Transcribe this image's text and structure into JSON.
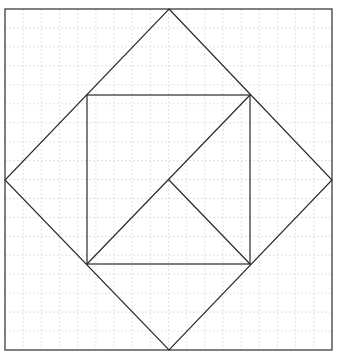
{
  "diagram": {
    "type": "geometric-figure",
    "colors": {
      "background": "#ffffff",
      "grid": "#d9d9d9",
      "lines": "#2b2b2b",
      "frame": "#4a4a4a"
    },
    "grid": {
      "divisions": 18,
      "dashed": true
    },
    "outer_square": {
      "x1": 5,
      "y1": 9,
      "x2": 332,
      "y2": 350
    },
    "diamond": {
      "points": [
        [
          169,
          9
        ],
        [
          332,
          180
        ],
        [
          169,
          350
        ],
        [
          5,
          180
        ]
      ]
    },
    "inner_square": {
      "x1": 87,
      "y1": 95,
      "x2": 250,
      "y2": 264
    },
    "diagonal": {
      "from": [
        87,
        264
      ],
      "to": [
        250,
        95
      ]
    },
    "center_segment": {
      "from": [
        169,
        180
      ],
      "to": [
        250,
        264
      ]
    }
  }
}
